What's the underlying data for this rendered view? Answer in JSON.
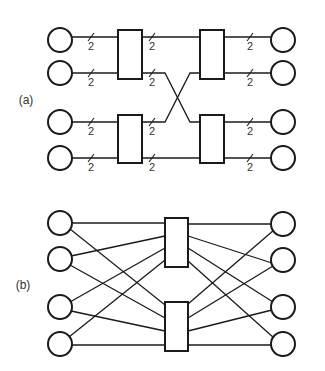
{
  "figure": {
    "width": 325,
    "height": 371,
    "stroke_color": "#1a1a1a",
    "text_color": "#333333"
  },
  "diagram_a": {
    "label": "(a)",
    "label_pos": [
      26,
      104
    ],
    "bus_width_label": "2",
    "input_nodes": [
      {
        "id": "a-in-1",
        "cx": 60,
        "cy": 40
      },
      {
        "id": "a-in-2",
        "cx": 60,
        "cy": 73
      },
      {
        "id": "a-in-3",
        "cx": 60,
        "cy": 122
      },
      {
        "id": "a-in-4",
        "cx": 60,
        "cy": 158
      }
    ],
    "output_nodes": [
      {
        "id": "a-out-1",
        "cx": 283,
        "cy": 40
      },
      {
        "id": "a-out-2",
        "cx": 283,
        "cy": 73
      },
      {
        "id": "a-out-3",
        "cx": 283,
        "cy": 122
      },
      {
        "id": "a-out-4",
        "cx": 283,
        "cy": 158
      }
    ],
    "switches": [
      {
        "id": "a-sw-1",
        "x": 118,
        "y": 30,
        "w": 24,
        "h": 49
      },
      {
        "id": "a-sw-2",
        "x": 200,
        "y": 30,
        "w": 24,
        "h": 49
      },
      {
        "id": "a-sw-3",
        "x": 118,
        "y": 115,
        "w": 24,
        "h": 48
      },
      {
        "id": "a-sw-4",
        "x": 200,
        "y": 115,
        "w": 24,
        "h": 48
      }
    ],
    "wires": [
      {
        "points": [
          [
            72,
            37
          ],
          [
            118,
            37
          ]
        ],
        "slash_x": 91
      },
      {
        "points": [
          [
            72,
            73
          ],
          [
            118,
            73
          ]
        ],
        "slash_x": 91
      },
      {
        "points": [
          [
            72,
            122
          ],
          [
            118,
            122
          ]
        ],
        "slash_x": 91
      },
      {
        "points": [
          [
            72,
            158
          ],
          [
            118,
            158
          ]
        ],
        "slash_x": 91
      },
      {
        "points": [
          [
            142,
            37
          ],
          [
            200,
            37
          ]
        ],
        "slash_x": 152
      },
      {
        "points": [
          [
            142,
            73
          ],
          [
            165,
            73
          ],
          [
            190,
            122
          ],
          [
            200,
            122
          ]
        ],
        "slash_x": 152
      },
      {
        "points": [
          [
            142,
            122
          ],
          [
            165,
            122
          ],
          [
            190,
            73
          ],
          [
            200,
            73
          ]
        ],
        "slash_x": 152
      },
      {
        "points": [
          [
            142,
            158
          ],
          [
            200,
            158
          ]
        ],
        "slash_x": 152
      },
      {
        "points": [
          [
            224,
            37
          ],
          [
            271,
            37
          ]
        ],
        "slash_x": 250
      },
      {
        "points": [
          [
            224,
            73
          ],
          [
            271,
            73
          ]
        ],
        "slash_x": 250
      },
      {
        "points": [
          [
            224,
            122
          ],
          [
            271,
            122
          ]
        ],
        "slash_x": 250
      },
      {
        "points": [
          [
            224,
            158
          ],
          [
            271,
            158
          ]
        ],
        "slash_x": 250
      }
    ]
  },
  "diagram_b": {
    "label": "(b)",
    "label_pos": [
      23,
      289
    ],
    "input_nodes": [
      {
        "id": "b-in-1",
        "cx": 60,
        "cy": 223
      },
      {
        "id": "b-in-2",
        "cx": 60,
        "cy": 259
      },
      {
        "id": "b-in-3",
        "cx": 60,
        "cy": 307
      },
      {
        "id": "b-in-4",
        "cx": 60,
        "cy": 344
      }
    ],
    "output_nodes": [
      {
        "id": "b-out-1",
        "cx": 283,
        "cy": 224
      },
      {
        "id": "b-out-2",
        "cx": 283,
        "cy": 260
      },
      {
        "id": "b-out-3",
        "cx": 283,
        "cy": 307
      },
      {
        "id": "b-out-4",
        "cx": 283,
        "cy": 344
      }
    ],
    "switches": [
      {
        "id": "b-sw-1",
        "x": 165,
        "y": 218,
        "w": 23,
        "h": 49
      },
      {
        "id": "b-sw-2",
        "x": 165,
        "y": 302,
        "w": 23,
        "h": 49
      }
    ],
    "wires": [
      {
        "points": [
          [
            72,
            223
          ],
          [
            165,
            223
          ]
        ]
      },
      {
        "points": [
          [
            70,
            229
          ],
          [
            165,
            305
          ]
        ]
      },
      {
        "points": [
          [
            71,
            256
          ],
          [
            165,
            236
          ]
        ]
      },
      {
        "points": [
          [
            70,
            265
          ],
          [
            165,
            318
          ]
        ]
      },
      {
        "points": [
          [
            70,
            302
          ],
          [
            165,
            248
          ]
        ]
      },
      {
        "points": [
          [
            71,
            311
          ],
          [
            165,
            331
          ]
        ]
      },
      {
        "points": [
          [
            69,
            337
          ],
          [
            165,
            260
          ]
        ]
      },
      {
        "points": [
          [
            72,
            345
          ],
          [
            165,
            345
          ]
        ]
      },
      {
        "points": [
          [
            188,
            224
          ],
          [
            271,
            224
          ]
        ]
      },
      {
        "points": [
          [
            188,
            236
          ],
          [
            272,
            263
          ]
        ]
      },
      {
        "points": [
          [
            188,
            248
          ],
          [
            273,
            302
          ]
        ]
      },
      {
        "points": [
          [
            188,
            261
          ],
          [
            274,
            338
          ]
        ]
      },
      {
        "points": [
          [
            188,
            304
          ],
          [
            274,
            230
          ]
        ]
      },
      {
        "points": [
          [
            188,
            318
          ],
          [
            273,
            266
          ]
        ]
      },
      {
        "points": [
          [
            188,
            331
          ],
          [
            272,
            310
          ]
        ]
      },
      {
        "points": [
          [
            188,
            345
          ],
          [
            271,
            345
          ]
        ]
      }
    ]
  },
  "node_radius": 12
}
